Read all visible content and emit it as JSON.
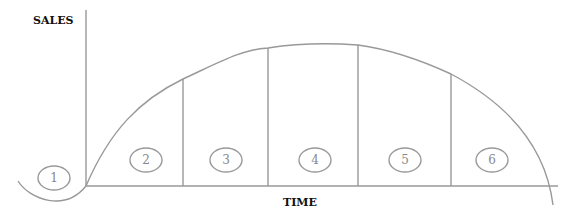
{
  "diagram": {
    "y_axis_label": "SALES",
    "x_axis_label": "TIME",
    "stages": [
      {
        "id": "1",
        "label": "1"
      },
      {
        "id": "2",
        "label": "2"
      },
      {
        "id": "3",
        "label": "3"
      },
      {
        "id": "4",
        "label": "4"
      },
      {
        "id": "5",
        "label": "5"
      },
      {
        "id": "6",
        "label": "6"
      }
    ],
    "line_color": "#999999"
  }
}
